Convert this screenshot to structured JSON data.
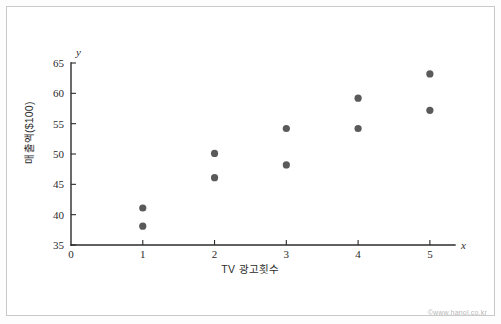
{
  "figure": {
    "watermark": "©www.hanol.co.kr",
    "border_color": "#c9c9c9",
    "background_color": "#ffffff",
    "point_color": "#5a5a5a",
    "axis_color": "#2b2b2b"
  },
  "chart_data": {
    "type": "scatter",
    "title": "",
    "xlabel": "TV 광고횟수",
    "ylabel": "매출액($100)",
    "x_var_symbol": "x",
    "y_var_symbol": "y",
    "xlim": [
      0,
      5.35
    ],
    "ylim": [
      35,
      65
    ],
    "xticks": [
      0,
      1,
      2,
      3,
      4,
      5
    ],
    "xtick_labels": [
      "0",
      "1",
      "2",
      "3",
      "4",
      "5"
    ],
    "yticks": [
      35,
      40,
      45,
      50,
      55,
      60,
      65
    ],
    "ytick_labels": [
      "35",
      "40",
      "45",
      "50",
      "55",
      "60",
      "65"
    ],
    "grid": false,
    "legend": false,
    "points": [
      {
        "x": 1,
        "y": 41.1
      },
      {
        "x": 1,
        "y": 38.1
      },
      {
        "x": 2,
        "y": 50.1
      },
      {
        "x": 2,
        "y": 46.1
      },
      {
        "x": 3,
        "y": 54.2
      },
      {
        "x": 3,
        "y": 48.2
      },
      {
        "x": 4,
        "y": 59.2
      },
      {
        "x": 4,
        "y": 54.2
      },
      {
        "x": 5,
        "y": 63.2
      },
      {
        "x": 5,
        "y": 57.2
      }
    ]
  }
}
